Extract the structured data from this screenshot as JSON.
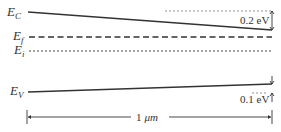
{
  "diagram": {
    "labels": {
      "ec": {
        "main": "E",
        "sub": "C"
      },
      "ef": {
        "main": "E",
        "sub": "f"
      },
      "ei": {
        "main": "E",
        "sub": "i"
      },
      "ev": {
        "main": "E",
        "sub": "V"
      }
    },
    "annotations": {
      "top_offset": "0.2 eV",
      "bottom_offset": "0.1 eV",
      "width_number": "1",
      "width_unit": "μm"
    },
    "colors": {
      "line": "#333333",
      "text": "#333333",
      "guide": "#888888"
    }
  }
}
